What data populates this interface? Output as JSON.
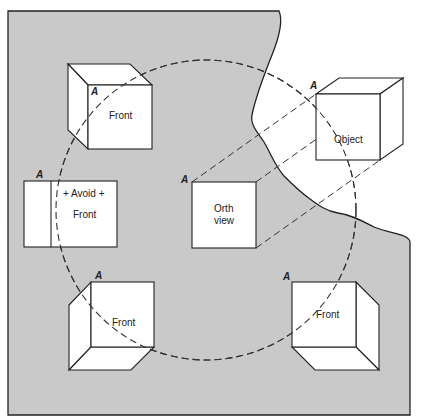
{
  "diagram": {
    "colors": {
      "background": "#ffffff",
      "region_fill": "#c9c9c9",
      "line": "#222222",
      "face_fill": "#ffffff"
    },
    "region": {
      "description": "Gray picture plane region with torn right edge"
    },
    "circle": {
      "style": "dashed",
      "cx": 206,
      "cy": 210,
      "r": 150
    },
    "cubes": [
      {
        "id": "top-left-cube",
        "face_label": "Front",
        "vertex_label": "A"
      },
      {
        "id": "avoid-box",
        "top_label": "+ Avoid +",
        "face_label": "Front",
        "vertex_label": "A"
      },
      {
        "id": "orth-view",
        "line1": "Orth",
        "line2": "view",
        "vertex_label": "A"
      },
      {
        "id": "object-cube",
        "face_label": "Object",
        "vertex_label": "A"
      },
      {
        "id": "bottom-left-cube",
        "face_label": "Front",
        "vertex_label": "A"
      },
      {
        "id": "bottom-right-cube",
        "face_label": "Front",
        "vertex_label": "A"
      }
    ]
  }
}
